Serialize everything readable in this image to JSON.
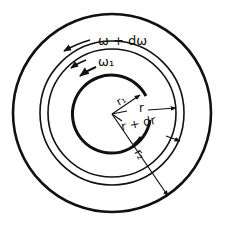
{
  "diagram": {
    "colors": {
      "stroke": "#111111",
      "background": "#ffffff"
    },
    "center": {
      "x": 112,
      "y": 113
    },
    "circles": [
      {
        "id": "outer-cylinder",
        "r": 99,
        "stroke_width": 2.6
      },
      {
        "id": "fluid-shell-outer",
        "r": 72,
        "stroke_width": 1.6
      },
      {
        "id": "fluid-shell-inner",
        "r": 64,
        "stroke_width": 1.6
      },
      {
        "id": "inner-cylinder",
        "r": 39,
        "stroke_width": 3.0
      }
    ],
    "labels": {
      "omega_plus_domega": "ω + dω",
      "omega_1": "ω₁",
      "r1": "r₁",
      "r": "r",
      "r_plus_dr": "r + dr",
      "r2": "r₂"
    }
  }
}
